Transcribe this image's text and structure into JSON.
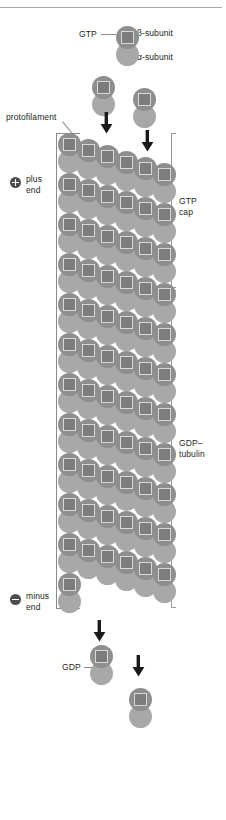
{
  "figure": {
    "top_rule": true
  },
  "labels": {
    "gtp": "GTP",
    "beta_subunit": "β-subunit",
    "alpha_subunit": "α-subunit",
    "protofilament": "protofilament",
    "plus_end": "plus\nend",
    "minus_end": "minus\nend",
    "gtp_cap": "GTP\ncap",
    "gdp_tubulin": "GDP–\ntubulin",
    "gdp": "GDP"
  },
  "icons": {
    "plus_end_badge": "plus-circle-icon",
    "minus_end_badge": "minus-circle-icon",
    "arrow_down": "arrow-down-icon",
    "nucleotide_square": "nucleotide-square-icon"
  },
  "colors": {
    "beta_subunit": "#8e8e8e",
    "alpha_subunit": "#a8a8a8",
    "nucleotide_square": "#7d7d7d",
    "nucleotide_border": "#d8d8d8",
    "bracket": "#9a9a9a",
    "leader": "#8a8a8a",
    "text": "#231f20",
    "badge": "#4d4d4d",
    "top_rule": "#a8a8a8",
    "background": "#ffffff"
  },
  "structure": {
    "columns": 6,
    "subunit_diameter_px": 23,
    "dimer_pitch_px": 40,
    "column_pitch_px": 19,
    "lattice_top_px": 133,
    "lattice_bottom_px": 608,
    "gtp_cap_rows": 4,
    "gdp_rows": 8,
    "cap_boundary_px": 290,
    "free_dimers": [
      {
        "name": "labeled-gtp-dimer",
        "x": 116,
        "y": 26,
        "nucleotide": "GTP"
      },
      {
        "name": "incoming-dimer-left",
        "x": 92,
        "y": 76,
        "nucleotide": "GTP"
      },
      {
        "name": "incoming-dimer-right",
        "x": 133,
        "y": 88,
        "nucleotide": "GTP"
      },
      {
        "name": "released-gdp-dimer",
        "x": 90,
        "y": 645,
        "nucleotide": "GDP"
      },
      {
        "name": "released-gdp-dimer-2",
        "x": 129,
        "y": 688,
        "nucleotide": "GDP"
      }
    ],
    "arrows": [
      {
        "name": "arrow-add-left",
        "x": 100,
        "y": 112
      },
      {
        "name": "arrow-add-right",
        "x": 141,
        "y": 130
      },
      {
        "name": "arrow-release-left",
        "x": 93,
        "y": 620
      },
      {
        "name": "arrow-release-right",
        "x": 132,
        "y": 655
      }
    ]
  }
}
